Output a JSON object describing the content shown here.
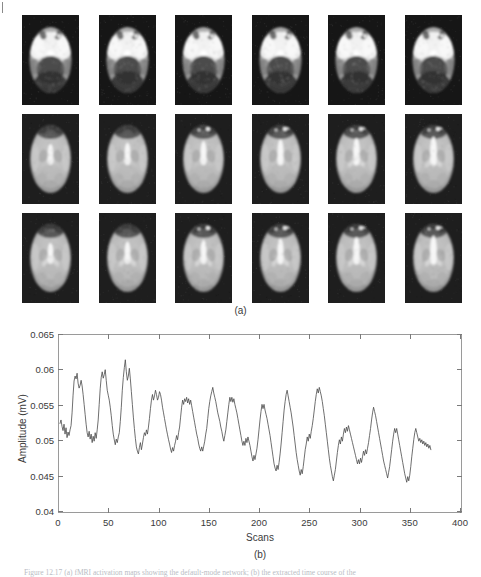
{
  "figure": {
    "panel_a": {
      "label": "(a)",
      "rows": 3,
      "columns": 6,
      "modality": "fMRI axial brain slices",
      "colormap": "grayscale"
    },
    "panel_b": {
      "label": "(b)"
    },
    "caption": "Figure 12.17 (a) fMRI activation maps showing the default-mode network; (b) the extracted time course of the"
  },
  "chart_data": {
    "type": "line",
    "title": "",
    "xlabel": "Scans",
    "ylabel": "Amplitude (mV)",
    "xlim": [
      0,
      400
    ],
    "ylim": [
      0.04,
      0.065
    ],
    "xticks": [
      0,
      50,
      100,
      150,
      200,
      250,
      300,
      350,
      400
    ],
    "xtick_labels": [
      "0",
      "50",
      "100",
      "150",
      "200",
      "250",
      "300",
      "350",
      "400"
    ],
    "yticks": [
      0.04,
      0.045,
      0.05,
      0.055,
      0.06,
      0.065
    ],
    "ytick_labels": [
      "0.04",
      "0.045",
      "0.05",
      "0.055",
      "0.06",
      "0.065"
    ],
    "grid": false,
    "legend": null,
    "line_color": "#4a4a4a",
    "line_width": 0.8,
    "series": [
      {
        "name": "BOLD signal amplitude",
        "x_start": 1,
        "x_end": 360,
        "x_step": 1,
        "values": [
          0.0525,
          0.053,
          0.0521,
          0.0515,
          0.0524,
          0.051,
          0.0519,
          0.0505,
          0.0513,
          0.0508,
          0.0516,
          0.0522,
          0.054,
          0.0565,
          0.0585,
          0.0592,
          0.0588,
          0.0596,
          0.0582,
          0.0575,
          0.0579,
          0.0586,
          0.0578,
          0.0566,
          0.0552,
          0.0538,
          0.0524,
          0.0512,
          0.0506,
          0.0514,
          0.0503,
          0.051,
          0.0498,
          0.0507,
          0.05,
          0.0512,
          0.0504,
          0.0516,
          0.053,
          0.0552,
          0.0574,
          0.059,
          0.0598,
          0.0589,
          0.0594,
          0.0601,
          0.0586,
          0.0572,
          0.0565,
          0.0558,
          0.0548,
          0.0536,
          0.0522,
          0.051,
          0.0502,
          0.0495,
          0.0503,
          0.0498,
          0.0506,
          0.0512,
          0.0528,
          0.0548,
          0.0572,
          0.059,
          0.0604,
          0.0615,
          0.0598,
          0.0586,
          0.0592,
          0.0603,
          0.0588,
          0.057,
          0.0552,
          0.0534,
          0.0518,
          0.0504,
          0.0492,
          0.0486,
          0.0482,
          0.0491,
          0.0498,
          0.0488,
          0.0496,
          0.0505,
          0.0512,
          0.0508,
          0.0516,
          0.051,
          0.052,
          0.0532,
          0.0546,
          0.0558,
          0.0566,
          0.0558,
          0.0564,
          0.0572,
          0.0566,
          0.0558,
          0.0562,
          0.057,
          0.0566,
          0.0558,
          0.0548,
          0.054,
          0.0532,
          0.0524,
          0.0516,
          0.0509,
          0.0502,
          0.0496,
          0.0489,
          0.0484,
          0.0491,
          0.0486,
          0.0494,
          0.05,
          0.0508,
          0.0502,
          0.0512,
          0.052,
          0.0534,
          0.0548,
          0.0558,
          0.0552,
          0.056,
          0.0556,
          0.0562,
          0.0554,
          0.056,
          0.0552,
          0.0558,
          0.055,
          0.0542,
          0.0534,
          0.0526,
          0.0518,
          0.051,
          0.0504,
          0.0496,
          0.049,
          0.0486,
          0.0492,
          0.0486,
          0.0493,
          0.05,
          0.051,
          0.0518,
          0.0532,
          0.0546,
          0.0556,
          0.0564,
          0.057,
          0.0576,
          0.0568,
          0.0562,
          0.0556,
          0.0548,
          0.054,
          0.0534,
          0.0528,
          0.052,
          0.0514,
          0.0506,
          0.05,
          0.0508,
          0.0516,
          0.0528,
          0.054,
          0.0552,
          0.0562,
          0.0556,
          0.0562,
          0.0555,
          0.056,
          0.0552,
          0.0546,
          0.054,
          0.0532,
          0.0524,
          0.0516,
          0.0508,
          0.05,
          0.0494,
          0.05,
          0.0494,
          0.0504,
          0.0498,
          0.0506,
          0.05,
          0.0494,
          0.0486,
          0.0478,
          0.0472,
          0.048,
          0.0474,
          0.0482,
          0.049,
          0.0502,
          0.0516,
          0.053,
          0.0542,
          0.0552,
          0.0546,
          0.0552,
          0.0544,
          0.0538,
          0.0532,
          0.0524,
          0.0516,
          0.0508,
          0.0498,
          0.0488,
          0.0478,
          0.0468,
          0.0462,
          0.0458,
          0.0466,
          0.046,
          0.047,
          0.0482,
          0.0496,
          0.0512,
          0.0528,
          0.0544,
          0.0556,
          0.0566,
          0.0572,
          0.0564,
          0.0556,
          0.0548,
          0.054,
          0.053,
          0.052,
          0.0508,
          0.0496,
          0.0484,
          0.0474,
          0.0466,
          0.0458,
          0.0452,
          0.046,
          0.0454,
          0.0464,
          0.0476,
          0.0488,
          0.0496,
          0.0506,
          0.05,
          0.051,
          0.0504,
          0.0514,
          0.0522,
          0.0532,
          0.0544,
          0.0556,
          0.0566,
          0.0574,
          0.0568,
          0.0576,
          0.057,
          0.0564,
          0.0556,
          0.0546,
          0.0536,
          0.0524,
          0.0512,
          0.05,
          0.0488,
          0.0476,
          0.0466,
          0.0458,
          0.045,
          0.0444,
          0.0452,
          0.046,
          0.0472,
          0.0484,
          0.0494,
          0.0502,
          0.0496,
          0.0506,
          0.05,
          0.051,
          0.0518,
          0.0512,
          0.052,
          0.0514,
          0.0522,
          0.0516,
          0.051,
          0.0504,
          0.0498,
          0.0492,
          0.0486,
          0.048,
          0.0474,
          0.0468,
          0.0474,
          0.0468,
          0.0476,
          0.047,
          0.0478,
          0.0486,
          0.048,
          0.0488,
          0.0482,
          0.049,
          0.0498,
          0.0508,
          0.0518,
          0.053,
          0.054,
          0.0548,
          0.0542,
          0.0536,
          0.0528,
          0.052,
          0.0512,
          0.0504,
          0.0496,
          0.0488,
          0.048,
          0.0472,
          0.0466,
          0.046,
          0.0454,
          0.0448,
          0.0456,
          0.0464,
          0.0476,
          0.0488,
          0.05,
          0.051,
          0.0518,
          0.0512,
          0.0518,
          0.051,
          0.0502,
          0.0494,
          0.0486,
          0.0478,
          0.047,
          0.0462,
          0.0454,
          0.0448,
          0.0442,
          0.045,
          0.0444,
          0.0452,
          0.0464,
          0.0478,
          0.049,
          0.0502,
          0.0512,
          0.0518,
          0.0512,
          0.0506,
          0.05,
          0.0504,
          0.0498,
          0.0502,
          0.0496,
          0.05,
          0.0494,
          0.0498,
          0.0492,
          0.0496,
          0.049,
          0.0494,
          0.0488
        ]
      }
    ]
  }
}
